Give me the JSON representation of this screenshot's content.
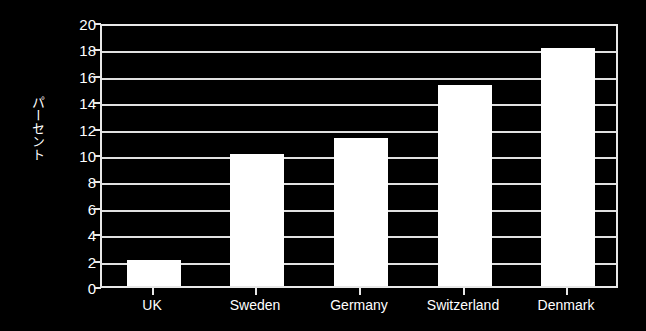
{
  "chart_data": {
    "type": "bar",
    "title": "",
    "xlabel": "",
    "ylabel": "パーセント",
    "categories": [
      "UK",
      "Sweden",
      "Germany",
      "Switzerland",
      "Denmark"
    ],
    "values": [
      2,
      10,
      11.2,
      15.2,
      18
    ],
    "series": [
      {
        "name": "パーセント",
        "values": [
          2,
          10,
          11.2,
          15.2,
          18
        ]
      }
    ],
    "ylim": [
      0,
      20
    ],
    "ytick_labels": [
      "0",
      "2",
      "4",
      "6",
      "8",
      "10",
      "12",
      "14",
      "16",
      "18",
      "20"
    ],
    "ytick_values": [
      0,
      2,
      4,
      6,
      8,
      10,
      12,
      14,
      16,
      18,
      20
    ],
    "grid": true,
    "legend": false,
    "legend_position": "none",
    "colors": {
      "background": "#000000",
      "bar_fill": "#ffffff",
      "axis": "#e8e8e8",
      "grid": "#e0e0e0",
      "text": "#ffffff"
    }
  }
}
